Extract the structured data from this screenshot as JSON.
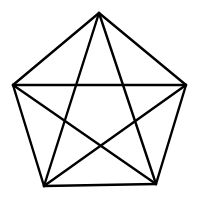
{
  "diagram": {
    "colors": {
      "background": "#ffffff",
      "stroke": "#000000"
    },
    "vertices": [
      {
        "id": "top",
        "x": 99,
        "y": 13
      },
      {
        "id": "right",
        "x": 186,
        "y": 85
      },
      {
        "id": "bottom-right",
        "x": 156,
        "y": 184
      },
      {
        "id": "bottom-left",
        "x": 44,
        "y": 186
      },
      {
        "id": "left",
        "x": 13,
        "y": 85
      }
    ],
    "edges": [
      [
        "top",
        "right"
      ],
      [
        "right",
        "bottom-right"
      ],
      [
        "bottom-right",
        "bottom-left"
      ],
      [
        "bottom-left",
        "left"
      ],
      [
        "left",
        "top"
      ],
      [
        "top",
        "bottom-right"
      ],
      [
        "top",
        "bottom-left"
      ],
      [
        "left",
        "right"
      ],
      [
        "left",
        "bottom-right"
      ],
      [
        "right",
        "bottom-left"
      ]
    ]
  }
}
